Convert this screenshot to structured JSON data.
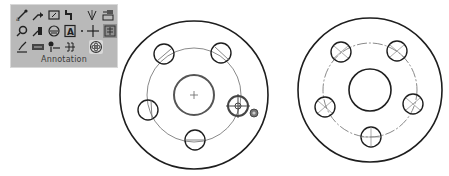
{
  "toolbar": {
    "panel_label": "Annotation",
    "rows": [
      [
        {
          "icon": "smart-dimension-icon",
          "name": "smart-dimension"
        },
        {
          "icon": "note-icon",
          "name": "note"
        },
        {
          "icon": "balloon-icon",
          "name": "balloon"
        },
        {
          "icon": "auto-balloon-icon",
          "name": "auto-balloon"
        },
        {
          "icon": "surface-finish-icon",
          "name": "surface-finish"
        },
        {
          "icon": "model-items-icon",
          "name": "model-items"
        }
      ],
      [
        {
          "icon": "magnetic-line-icon",
          "name": "magnetic-line"
        },
        {
          "icon": "weld-symbol-icon",
          "name": "weld-symbol"
        },
        {
          "icon": "hole-callout-icon",
          "name": "hole-callout"
        },
        {
          "icon": "datum-feature-icon",
          "name": "datum-feature"
        },
        {
          "icon": "centerline-icon",
          "name": "centerline"
        },
        {
          "icon": "revision-symbol-icon",
          "name": "revision-symbol"
        }
      ],
      [
        {
          "icon": "geometric-tolerance-icon",
          "name": "geometric-tolerance"
        },
        {
          "icon": "datum-target-icon",
          "name": "datum-target"
        },
        {
          "icon": "blocks-icon",
          "name": "blocks"
        },
        {
          "icon": "area-hatch-icon",
          "name": "area-hatch"
        },
        {
          "icon": "center-mark-icon",
          "name": "center-mark",
          "active": true
        }
      ]
    ]
  },
  "colors": {
    "panel_bg": "#b9b9b9",
    "line": "#1e1e1e",
    "construction_line": "#8a8a8a"
  },
  "drawings": [
    {
      "name": "flange-before",
      "cx": 194,
      "cy": 95,
      "outer_r": 74,
      "bolt_circle_r": 47,
      "center_hole_r": 20,
      "bolt_hole_r": 10,
      "bolt_count": 5,
      "has_centermarks": false,
      "cursor_on_hole": true
    },
    {
      "name": "flange-after",
      "cx": 370,
      "cy": 90,
      "outer_r": 72,
      "bolt_circle_r": 47,
      "center_hole_r": 21,
      "bolt_hole_r": 10,
      "bolt_count": 5,
      "has_centermarks": true
    }
  ]
}
